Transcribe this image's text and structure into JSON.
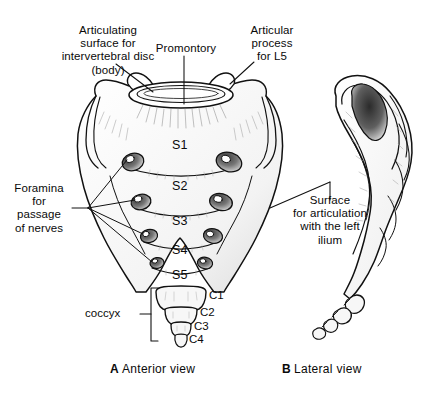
{
  "figure": {
    "background_color": "#ffffff",
    "ink_color": "#111111"
  },
  "labels": {
    "articulating_surface": "Articulating\nsurface for\nintervertebral disc\n(body)",
    "promontory": "Promontory",
    "articular_process": "Articular\nprocess\nfor L5",
    "foramina": "Foramina\nfor\npassage\nof nerves",
    "articulation_surface": "Surface\nfor articulation\nwith the left\nilium",
    "coccyx": "coccyx"
  },
  "sacral_segments": [
    {
      "id": "s1",
      "label": "S1"
    },
    {
      "id": "s2",
      "label": "S2"
    },
    {
      "id": "s3",
      "label": "S3"
    },
    {
      "id": "s4",
      "label": "S4"
    },
    {
      "id": "s5",
      "label": "S5"
    }
  ],
  "coccygeal_segments": [
    {
      "id": "c1",
      "label": "C1"
    },
    {
      "id": "c2",
      "label": "C2"
    },
    {
      "id": "c3",
      "label": "C3"
    },
    {
      "id": "c4",
      "label": "C4"
    }
  ],
  "captions": {
    "panel_a_letter": "A",
    "panel_a_text": "Anterior view",
    "panel_b_letter": "B",
    "panel_b_text": "Lateral view"
  }
}
